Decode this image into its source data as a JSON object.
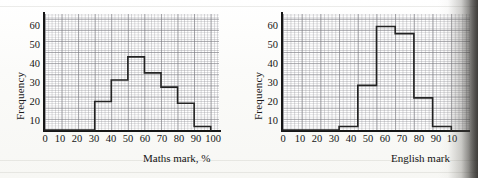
{
  "page": {
    "background_color": "#fdfdfb",
    "grid_color": "#9696a0",
    "axis_color": "#161616",
    "bar_outline_color": "#232323"
  },
  "chart_data": [
    {
      "type": "bar",
      "id": "maths",
      "title": "",
      "xlabel": "Maths mark, %",
      "ylabel": "Frequency",
      "categories": [
        "0-10",
        "10-20",
        "20-30",
        "30-40",
        "40-50",
        "50-60",
        "60-70",
        "70-80",
        "80-90",
        "90-100"
      ],
      "bin_edges": [
        0,
        10,
        20,
        30,
        40,
        50,
        60,
        70,
        80,
        90,
        100
      ],
      "values": [
        0,
        0,
        0,
        16,
        28,
        41,
        32,
        24,
        15,
        2
      ],
      "x_ticks": [
        "0",
        "10",
        "20",
        "30",
        "40",
        "50",
        "60",
        "70",
        "80",
        "90",
        "100"
      ],
      "y_ticks": [
        "10",
        "20",
        "30",
        "40",
        "50",
        "60"
      ],
      "xlim": [
        0,
        105
      ],
      "ylim": [
        0,
        65
      ],
      "grid": true,
      "legend": "none"
    },
    {
      "type": "bar",
      "id": "english",
      "title": "",
      "xlabel": "English mark",
      "ylabel": "Frequency",
      "categories": [
        "0-10",
        "10-20",
        "20-30",
        "30-40",
        "40-50",
        "50-60",
        "60-70",
        "70-80",
        "80-90"
      ],
      "bin_edges": [
        0,
        10,
        20,
        30,
        40,
        50,
        60,
        70,
        80,
        90
      ],
      "values": [
        0,
        0,
        0,
        2,
        25,
        58,
        54,
        18,
        2
      ],
      "x_ticks": [
        "0",
        "10",
        "20",
        "30",
        "40",
        "50",
        "60",
        "70",
        "80",
        "90",
        "10"
      ],
      "y_ticks": [
        "10",
        "20",
        "30",
        "40",
        "50",
        "60"
      ],
      "xlim": [
        0,
        100
      ],
      "ylim": [
        0,
        65
      ],
      "grid": true,
      "legend": "none"
    }
  ]
}
